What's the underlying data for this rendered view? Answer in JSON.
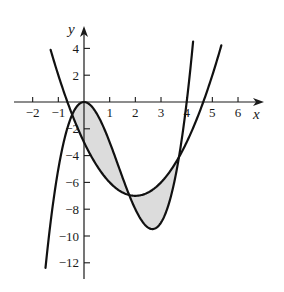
{
  "chart_data": {
    "type": "line",
    "title": "",
    "xlabel": "x",
    "ylabel": "y",
    "xlim": [
      -2.7,
      7.0
    ],
    "ylim": [
      -13.2,
      5.7
    ],
    "grid": false,
    "x_ticks": [
      -2,
      -1,
      1,
      2,
      3,
      4,
      5,
      6
    ],
    "x_tick_labels": [
      "−2",
      "−1",
      "1",
      "2",
      "3",
      "4",
      "5",
      "6"
    ],
    "y_ticks": [
      4,
      2,
      -2,
      -4,
      -6,
      -8,
      -10,
      -12
    ],
    "y_tick_labels": [
      "4",
      "2",
      "−2",
      "−4",
      "−6",
      "−8",
      "−10",
      "−12"
    ],
    "series": [
      {
        "name": "cubic",
        "equation": "y = x^3 - 4x^2",
        "coefficients": [
          1,
          -4,
          0,
          0
        ],
        "x_range": [
          -1.5,
          4.25
        ],
        "color": "#111111"
      },
      {
        "name": "parabola",
        "equation": "y = x^2 - 4x - 3",
        "coefficients": [
          0,
          1,
          -4,
          -3
        ],
        "x_range": [
          -1.3,
          5.35
        ],
        "color": "#111111"
      }
    ],
    "shaded_region": {
      "between": [
        "cubic",
        "parabola"
      ],
      "x_range": [
        -0.46,
        3.69
      ],
      "fill": "#dcdcdc"
    },
    "intersections_x": [
      -0.46,
      1.77,
      3.69
    ]
  },
  "layout": {
    "origin_px": [
      84,
      102
    ],
    "px_per_unit_x": 25.67,
    "px_per_unit_y": 13.4,
    "x_axis_px": [
      14,
      264
    ],
    "y_axis_px": [
      279,
      26
    ]
  }
}
